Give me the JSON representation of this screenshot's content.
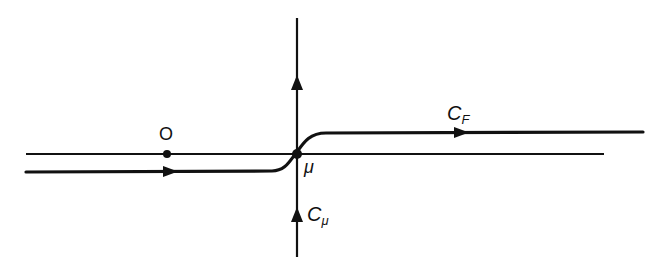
{
  "diagram": {
    "type": "complex-plane contour",
    "colors": {
      "ink": "#111111",
      "background": "#ffffff"
    },
    "real_axis": {
      "y": 154,
      "x_start": 26,
      "x_end": 604
    },
    "imaginary_line": {
      "x": 297,
      "y_start": 18,
      "y_end": 257
    },
    "points": [
      {
        "id": "origin",
        "label": "O",
        "x": 167,
        "y": 154
      },
      {
        "id": "mu",
        "label": "μ",
        "x": 297,
        "y": 154
      }
    ],
    "contours": [
      {
        "id": "C_F",
        "label_main": "C",
        "label_sub": "F",
        "description": "path below axis on left, crossing at μ, above axis on right, directed left to right"
      },
      {
        "id": "C_mu",
        "label_main": "C",
        "label_sub": "μ",
        "description": "vertical path through μ, directed upward"
      }
    ],
    "labels": {
      "origin": "O",
      "mu": "μ",
      "cf_main": "C",
      "cf_sub": "F",
      "cmu_main": "C",
      "cmu_sub": "μ"
    }
  }
}
